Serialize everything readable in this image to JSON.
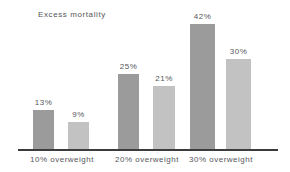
{
  "chart_data": {
    "type": "bar",
    "title": "Excess mortality",
    "xlabel": "",
    "ylabel": "",
    "ylim": [
      0,
      45
    ],
    "grid": false,
    "legend": false,
    "categories": [
      "10% overweight",
      "20% overweight",
      "30% overweight"
    ],
    "series": [
      {
        "name": "dark",
        "color": "#9b9b9b",
        "values": [
          13,
          25,
          42
        ],
        "labels": [
          "13%",
          "25%",
          "42%"
        ]
      },
      {
        "name": "light",
        "color": "#c2c2c2",
        "values": [
          9,
          21,
          30
        ],
        "labels": [
          "9%",
          "21%",
          "30%"
        ]
      }
    ],
    "bars": [
      {
        "label": "13%",
        "value": 13,
        "style": "dark",
        "left": 33,
        "width": 21,
        "height": 39
      },
      {
        "label": "9%",
        "value": 9,
        "style": "light",
        "left": 68,
        "width": 21,
        "height": 27
      },
      {
        "label": "25%",
        "value": 25,
        "style": "dark",
        "left": 118,
        "width": 21,
        "height": 75
      },
      {
        "label": "21%",
        "value": 21,
        "style": "light",
        "left": 153,
        "width": 22,
        "height": 63
      },
      {
        "label": "42%",
        "value": 42,
        "style": "dark",
        "left": 190,
        "width": 25,
        "height": 125
      },
      {
        "label": "30%",
        "value": 30,
        "style": "light",
        "left": 226,
        "width": 25,
        "height": 90
      }
    ],
    "category_positions": [
      {
        "label": "10% overweight",
        "center": 62
      },
      {
        "label": "20% overweight",
        "center": 147
      },
      {
        "label": "30% overweight",
        "center": 221
      }
    ]
  }
}
